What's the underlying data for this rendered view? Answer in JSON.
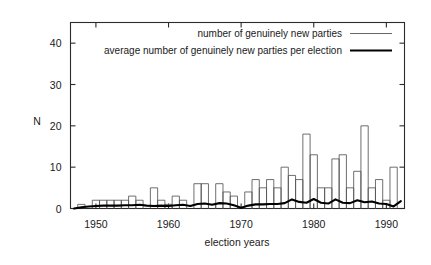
{
  "chart_data": {
    "type": "bar",
    "title": "",
    "xlabel": "election years",
    "ylabel": "N",
    "xlim": [
      1946.5,
      1992.5
    ],
    "ylim": [
      0,
      45
    ],
    "xticks": [
      1950,
      1960,
      1970,
      1980,
      1990
    ],
    "yticks": [
      0,
      10,
      20,
      30,
      40
    ],
    "ytick_labels": [
      "0",
      "10",
      "20",
      "30",
      "40"
    ],
    "xtick_labels": [
      "1950",
      "1960",
      "1970",
      "1980",
      "1990"
    ],
    "grid": false,
    "legend_position": "top-right",
    "series": [
      {
        "name": "number of genuinely new parties",
        "style": "bar",
        "color": "#555555",
        "x": [
          1948,
          1949,
          1950,
          1951,
          1952,
          1953,
          1954,
          1955,
          1956,
          1957,
          1958,
          1959,
          1960,
          1961,
          1962,
          1963,
          1964,
          1965,
          1966,
          1967,
          1968,
          1969,
          1970,
          1971,
          1972,
          1973,
          1974,
          1975,
          1976,
          1977,
          1978,
          1979,
          1980,
          1981,
          1982,
          1983,
          1984,
          1985,
          1986,
          1987,
          1988,
          1989,
          1990,
          1991
        ],
        "values": [
          1,
          0,
          2,
          2,
          2,
          2,
          2,
          3,
          2,
          0,
          5,
          2,
          1,
          3,
          2,
          0,
          6,
          6,
          1,
          6,
          4,
          3,
          0,
          4,
          7,
          5,
          7,
          5,
          10,
          8,
          7,
          18,
          13,
          5,
          5,
          12,
          13,
          5,
          9,
          20,
          5,
          7,
          2,
          10
        ]
      },
      {
        "name": "average number of genuinely new parties per election",
        "style": "line",
        "color": "#000000",
        "x": [
          1947,
          1948,
          1949,
          1950,
          1951,
          1952,
          1953,
          1954,
          1955,
          1956,
          1957,
          1958,
          1959,
          1960,
          1961,
          1962,
          1963,
          1964,
          1965,
          1966,
          1967,
          1968,
          1969,
          1970,
          1971,
          1972,
          1973,
          1974,
          1975,
          1976,
          1977,
          1978,
          1979,
          1980,
          1981,
          1982,
          1983,
          1984,
          1985,
          1986,
          1987,
          1988,
          1989,
          1990,
          1991,
          1992
        ],
        "values": [
          0.0,
          0.3,
          0.5,
          0.6,
          0.7,
          0.7,
          0.7,
          0.8,
          0.8,
          0.9,
          0.7,
          0.6,
          0.7,
          0.6,
          0.8,
          0.9,
          0.6,
          1.1,
          1.2,
          0.9,
          1.3,
          1.2,
          0.8,
          0.2,
          0.7,
          1.0,
          1.0,
          1.1,
          1.1,
          1.3,
          2.2,
          1.6,
          1.4,
          2.3,
          1.4,
          1.2,
          2.2,
          1.4,
          1.3,
          2.0,
          1.5,
          1.7,
          1.2,
          1.1,
          0.5,
          1.8
        ]
      }
    ]
  },
  "legend": {
    "entries": [
      {
        "label": "number of genuinely new parties",
        "marker": "thin-line"
      },
      {
        "label": "average number of genuinely new parties per election",
        "marker": "thick-line"
      }
    ]
  }
}
